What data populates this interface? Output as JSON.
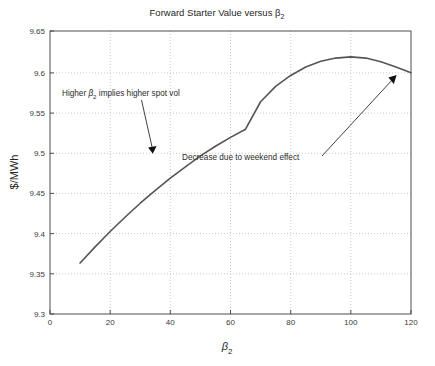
{
  "figure": {
    "background_color": "#ffffff",
    "title": "Forward Starter Value versus β",
    "title_sub": "2"
  },
  "axes": {
    "y_label_main": "$/MWh",
    "x_label_main": "β",
    "x_label_sub": "2",
    "x_ticks": [
      "0",
      "20",
      "40",
      "60",
      "80",
      "100",
      "120"
    ],
    "y_ticks": [
      "9.3",
      "9.35",
      "9.4",
      "9.45",
      "9.5",
      "9.55",
      "9.6",
      "9.65"
    ]
  },
  "annotations": {
    "a1_pre": "Higher ",
    "a1_beta": "β",
    "a1_sub": "2",
    "a1_post": " implies higher spot vol",
    "a2": "Decrease due to weekend effect"
  },
  "colors": {
    "curve": "#555555",
    "grid": "#bdbdbd",
    "axis": "#4d4d4d",
    "text": "#262626"
  },
  "chart_data": {
    "type": "line",
    "xlabel": "β₂",
    "ylabel": "$/MWh",
    "xlim": [
      0,
      120
    ],
    "ylim": [
      9.3,
      9.65
    ],
    "xticks": [
      0,
      20,
      40,
      60,
      80,
      100,
      120
    ],
    "yticks": [
      9.3,
      9.35,
      9.4,
      9.45,
      9.5,
      9.55,
      9.6,
      9.65
    ],
    "grid": true,
    "legend": null,
    "series": [
      {
        "name": "Forward starter value",
        "x": [
          10,
          15,
          20,
          25,
          30,
          35,
          40,
          45,
          50,
          55,
          60,
          65,
          70,
          75,
          80,
          85,
          90,
          95,
          100,
          105,
          110,
          115,
          120
        ],
        "y": [
          9.363,
          9.383,
          9.402,
          9.42,
          9.437,
          9.453,
          9.468,
          9.482,
          9.4955,
          9.5075,
          9.5185,
          9.5285,
          9.5625,
          9.5815,
          9.595,
          9.6055,
          9.6125,
          9.6165,
          9.618,
          9.6165,
          9.612,
          9.6055,
          9.5985
        ]
      }
    ],
    "annotations": [
      {
        "text": "Higher β₂ implies higher spot vol",
        "text_xy": [
          19,
          9.567
        ],
        "arrow_from": [
          27,
          9.555
        ],
        "arrow_to": [
          32,
          9.502
        ]
      },
      {
        "text": "Decrease due to weekend effect",
        "text_xy": [
          58,
          9.497
        ],
        "arrow_from": [
          77,
          9.489
        ],
        "arrow_to": [
          116,
          9.6
        ]
      }
    ]
  }
}
